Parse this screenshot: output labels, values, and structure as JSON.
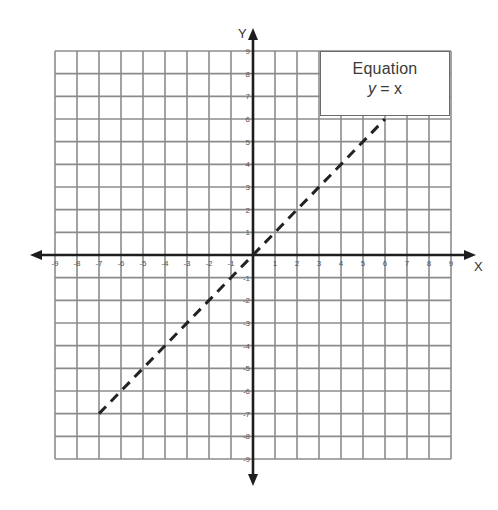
{
  "chart_data": {
    "type": "line",
    "title": "",
    "xlabel": "X",
    "ylabel": "Y",
    "xlim": [
      -9,
      9
    ],
    "ylim": [
      -9,
      9
    ],
    "grid": true,
    "x_ticks": [
      -9,
      -8,
      -7,
      -6,
      -5,
      -4,
      -3,
      -2,
      -1,
      1,
      2,
      3,
      4,
      5,
      6,
      7,
      8,
      9
    ],
    "y_ticks": [
      -9,
      -8,
      -7,
      -6,
      -5,
      -4,
      -3,
      -2,
      -1,
      1,
      2,
      3,
      4,
      5,
      6,
      7,
      8,
      9
    ],
    "series": [
      {
        "name": "y = x",
        "style": "dashed",
        "color": "#222222",
        "x": [
          -7,
          6
        ],
        "y": [
          -7,
          6
        ]
      }
    ],
    "legend": {
      "position": "top-right",
      "title": "Equation",
      "entry_lhs": "y",
      "entry_rhs": " = x"
    }
  },
  "colors": {
    "grid": "#8c8c8c",
    "axis": "#1e1e1e",
    "tick_label": "#555555",
    "background": "#ffffff"
  }
}
